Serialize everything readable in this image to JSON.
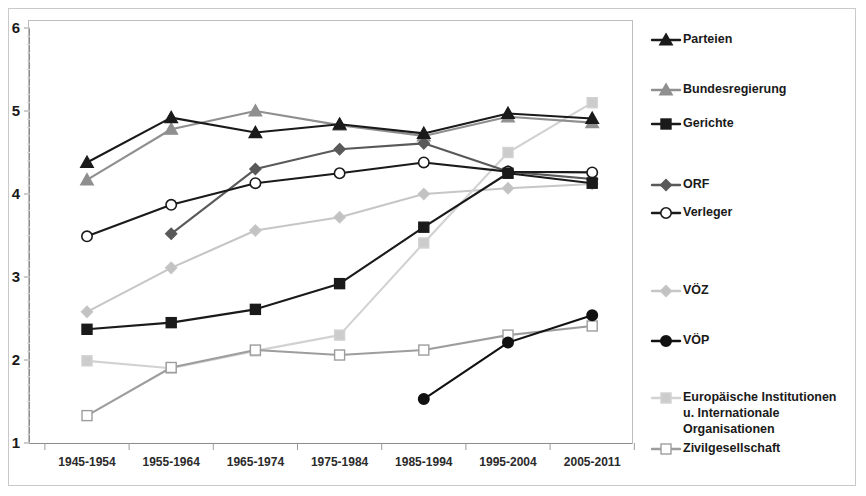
{
  "chart_data": {
    "type": "line",
    "title": "",
    "subtitle": "",
    "xlabel": "",
    "ylabel": "",
    "xlim_categories": 7,
    "ylim": [
      1,
      6
    ],
    "yticks": [
      "1",
      "2",
      "3",
      "4",
      "5",
      "6"
    ],
    "grid": false,
    "legend_position": "right",
    "categories": [
      "1945-1954",
      "1955-1964",
      "1965-1974",
      "1975-1984",
      "1985-1994",
      "1995-2004",
      "2005-2011"
    ],
    "series": [
      {
        "name": "Parteien",
        "color": "#1a1a1a",
        "marker": "triangle",
        "marker_fill": "#1a1a1a",
        "values": [
          4.38,
          4.92,
          4.74,
          4.84,
          4.73,
          4.97,
          4.91
        ]
      },
      {
        "name": "Bundesregierung",
        "color": "#8f8f8f",
        "marker": "triangle",
        "marker_fill": "#8f8f8f",
        "values": [
          4.17,
          4.78,
          5.0,
          4.83,
          4.7,
          4.93,
          4.86
        ]
      },
      {
        "name": "Gerichte",
        "color": "#1a1a1a",
        "marker": "square",
        "marker_fill": "#1a1a1a",
        "values": [
          2.37,
          2.45,
          2.61,
          2.92,
          3.6,
          4.25,
          4.13
        ]
      },
      {
        "name": "ORF",
        "color": "#595959",
        "marker": "diamond",
        "marker_fill": "#595959",
        "values": [
          null,
          3.52,
          4.3,
          4.54,
          4.61,
          4.27,
          4.18
        ]
      },
      {
        "name": "Verleger",
        "color": "#1a1a1a",
        "marker": "circle",
        "marker_fill": "#ffffff",
        "values": [
          3.49,
          3.87,
          4.13,
          4.25,
          4.38,
          4.27,
          4.26
        ]
      },
      {
        "name": "VÖZ",
        "color": "#c6c6c6",
        "marker": "diamond",
        "marker_fill": "#c2c2c2",
        "values": [
          2.58,
          3.11,
          3.56,
          3.72,
          4.0,
          4.07,
          4.12
        ]
      },
      {
        "name": "VÖP",
        "color": "#111111",
        "marker": "circle",
        "marker_fill": "#111111",
        "values": [
          null,
          null,
          null,
          null,
          1.53,
          2.21,
          2.54
        ]
      },
      {
        "name": "Europäische Institutionen u. Internationale Organisationen",
        "color": "#d2d2d2",
        "marker": "square",
        "marker_fill": "#cccccc",
        "values": [
          1.99,
          1.9,
          2.11,
          2.3,
          3.41,
          4.5,
          5.1
        ]
      },
      {
        "name": "Zivilgesellschaft",
        "color": "#9d9d9d",
        "marker": "square",
        "marker_fill": "#ffffff",
        "values": [
          1.33,
          1.91,
          2.12,
          2.06,
          2.12,
          2.3,
          2.41
        ]
      }
    ],
    "legend_entries": [
      {
        "label": "Parteien",
        "lines": [
          "Parteien"
        ]
      },
      {
        "label": "Bundesregierung",
        "lines": [
          "Bundesregierung"
        ]
      },
      {
        "label": "Gerichte",
        "lines": [
          "Gerichte"
        ]
      },
      {
        "label": "ORF",
        "lines": [
          "ORF"
        ]
      },
      {
        "label": "Verleger",
        "lines": [
          "Verleger"
        ]
      },
      {
        "label": "VÖZ",
        "lines": [
          "VÖZ"
        ]
      },
      {
        "label": "VÖP",
        "lines": [
          "VÖP"
        ]
      },
      {
        "label": "Europäische Institutionen u. Internationale Organisationen",
        "lines": [
          "Europäische Institutionen",
          "u. Internationale",
          "Organisationen"
        ]
      },
      {
        "label": "Zivilgesellschaft",
        "lines": [
          "Zivilgesellschaft"
        ]
      }
    ]
  }
}
